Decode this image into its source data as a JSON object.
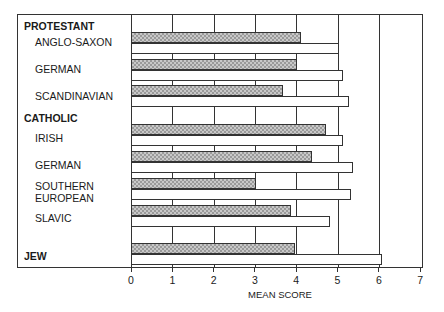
{
  "chart_data": {
    "type": "bar",
    "orientation": "horizontal",
    "title": "",
    "xlabel": "MEAN SCORE",
    "ylabel": "",
    "xlim": [
      0,
      7
    ],
    "xticks": [
      "0",
      "1",
      "2",
      "3",
      "4",
      "5",
      "6",
      "7"
    ],
    "grid": true,
    "groups": [
      {
        "name": "PROTESTANT",
        "categories": [
          "ANGLO-SAXON",
          "GERMAN",
          "SCANDINAVIAN"
        ]
      },
      {
        "name": "CATHOLIC",
        "categories": [
          "IRISH",
          "GERMAN",
          "SOUTHERN EUROPEAN",
          "SLAVIC"
        ]
      },
      {
        "name": "JEW",
        "categories": [
          "JEW"
        ]
      }
    ],
    "categories": [
      "Protestant ANGLO-SAXON",
      "Protestant GERMAN",
      "Protestant SCANDINAVIAN",
      "Catholic IRISH",
      "Catholic GERMAN",
      "Catholic SOUTHERN EUROPEAN",
      "Catholic SLAVIC",
      "JEW"
    ],
    "series": [
      {
        "name": "hatched",
        "pattern": "stippled gray",
        "values": [
          4.1,
          4.0,
          3.65,
          4.7,
          4.35,
          3.0,
          3.85,
          3.95
        ]
      },
      {
        "name": "open",
        "pattern": "white",
        "values": [
          5.0,
          5.1,
          5.25,
          5.1,
          5.35,
          5.3,
          4.8,
          6.05
        ]
      }
    ],
    "legend": null
  },
  "labels": {
    "protestant": "PROTESTANT",
    "anglo_saxon": "ANGLO-SAXON",
    "p_german": "GERMAN",
    "scandinavian": "SCANDINAVIAN",
    "catholic": "CATHOLIC",
    "irish": "IRISH",
    "c_german": "GERMAN",
    "southern1": "SOUTHERN",
    "southern2": "EUROPEAN",
    "slavic": "SLAVIC",
    "jew": "JEW"
  },
  "axis": {
    "ticks": [
      "0",
      "1",
      "2",
      "3",
      "4",
      "5",
      "6",
      "7"
    ],
    "label": "MEAN SCORE"
  }
}
